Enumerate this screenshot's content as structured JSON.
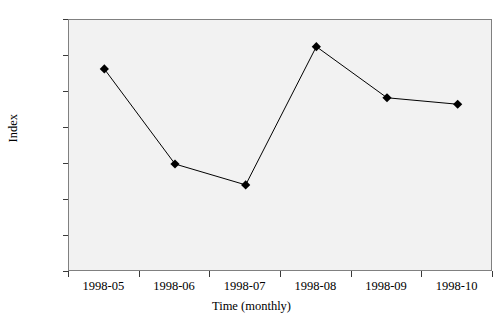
{
  "chart_data": {
    "type": "line",
    "title": "",
    "xlabel": "Time (monthly)",
    "ylabel": "Index",
    "categories": [
      "1998-05",
      "1998-06",
      "1998-07",
      "1998-08",
      "1998-09",
      "1998-10"
    ],
    "values": [
      128.82,
      127.5,
      127.21,
      129.13,
      128.42,
      128.33
    ],
    "ylim": [
      126.0,
      129.5
    ],
    "ytick_labels": [
      "126.0",
      "126.5",
      "127.0",
      "127.5",
      "128.0",
      "128.5",
      "129.0",
      "129.5"
    ],
    "ytick_values": [
      126.0,
      126.5,
      127.0,
      127.5,
      128.0,
      128.5,
      129.0,
      129.5
    ],
    "grid": false,
    "legend": null,
    "marker": "diamond",
    "marker_color": "#000000",
    "line_color": "#000000",
    "plot_background": "#f2f2f2",
    "axis_color": "#808080"
  }
}
